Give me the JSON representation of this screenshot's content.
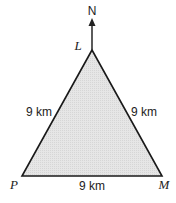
{
  "diagram": {
    "type": "equilateral triangle with north arrow",
    "north_label": "N",
    "vertices": {
      "top": "L",
      "bottom_left": "P",
      "bottom_right": "M"
    },
    "sides": {
      "LP": "9 km",
      "LM": "9 km",
      "PM": "9 km"
    },
    "colors": {
      "fill": "#e4e4e4",
      "stroke": "#1a1a1a"
    }
  }
}
